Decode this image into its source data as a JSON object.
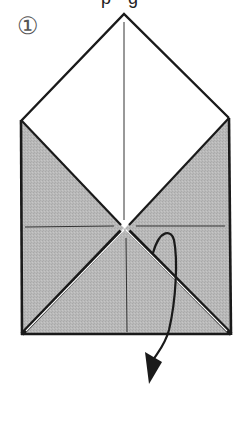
{
  "header": {
    "partial_text": "p g"
  },
  "step": {
    "number_label": "①"
  },
  "diagram": {
    "type": "origami-fold-step",
    "paper_colors": {
      "front": "#ffffff",
      "back": "#b8b8b8",
      "line": "#1a1a1a"
    },
    "arrow": {
      "description": "turn-over / fold-behind arrow"
    }
  }
}
